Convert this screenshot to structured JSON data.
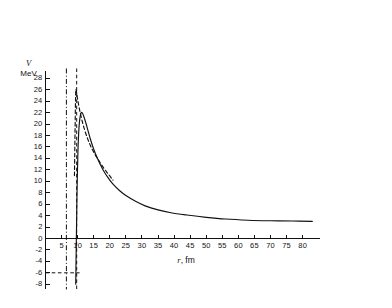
{
  "chart_data": {
    "type": "line",
    "title": "",
    "xlabel": "r, fm",
    "ylabel": "V MeV",
    "ylabel_symbol": "V",
    "ylabel_unit": "MeV",
    "xlim": [
      0,
      85
    ],
    "ylim": [
      -8,
      29
    ],
    "grid": false,
    "legend": "none",
    "x_ticks": [
      5,
      10,
      15,
      20,
      25,
      30,
      35,
      40,
      45,
      50,
      55,
      60,
      65,
      70,
      75,
      80
    ],
    "x_tick_labels": [
      "5",
      "10",
      "15",
      "20",
      "25",
      "30",
      "35",
      "40",
      "45",
      "50",
      "55",
      "60",
      "65",
      "70",
      "75",
      "80"
    ],
    "y_ticks": [
      -8,
      -6,
      -4,
      -2,
      0,
      2,
      4,
      6,
      8,
      10,
      12,
      14,
      16,
      18,
      20,
      22,
      24,
      26,
      28
    ],
    "y_tick_labels": [
      "-8",
      "-6",
      "-4",
      "-2",
      "0",
      "2",
      "4",
      "6",
      "8",
      "10",
      "12",
      "14",
      "16",
      "18",
      "20",
      "22",
      "24",
      "26",
      "28"
    ],
    "series": [
      {
        "name": "solid-potential-curve",
        "style": "solid",
        "color": "#111111",
        "points": [
          [
            9.4,
            -8.0
          ],
          [
            9.5,
            -4.0
          ],
          [
            9.6,
            0.0
          ],
          [
            9.7,
            4.0
          ],
          [
            9.8,
            8.0
          ],
          [
            9.95,
            12.0
          ],
          [
            10.1,
            15.5
          ],
          [
            10.3,
            18.2
          ],
          [
            10.5,
            20.0
          ],
          [
            10.8,
            21.4
          ],
          [
            11.1,
            22.0
          ],
          [
            11.5,
            21.9
          ],
          [
            12.0,
            21.2
          ],
          [
            12.6,
            20.1
          ],
          [
            13.3,
            18.7
          ],
          [
            14.0,
            17.3
          ],
          [
            15.0,
            15.6
          ],
          [
            16.0,
            14.2
          ],
          [
            17.0,
            13.0
          ],
          [
            18.0,
            11.9
          ],
          [
            19.5,
            10.6
          ],
          [
            21.0,
            9.5
          ],
          [
            23.0,
            8.4
          ],
          [
            25.0,
            7.5
          ],
          [
            28.0,
            6.5
          ],
          [
            31.0,
            5.7
          ],
          [
            35.0,
            5.0
          ],
          [
            39.0,
            4.5
          ],
          [
            44.0,
            4.1
          ],
          [
            50.0,
            3.7
          ],
          [
            56.0,
            3.4
          ],
          [
            63.0,
            3.2
          ],
          [
            70.0,
            3.1
          ],
          [
            77.0,
            3.05
          ],
          [
            83.0,
            3.0
          ]
        ]
      },
      {
        "name": "dashed-potential-curve",
        "style": "dashed",
        "color": "#111111",
        "points": [
          [
            9.0,
            11.0
          ],
          [
            9.1,
            15.0
          ],
          [
            9.2,
            19.0
          ],
          [
            9.3,
            23.0
          ],
          [
            9.4,
            25.6
          ],
          [
            9.5,
            26.1
          ],
          [
            9.7,
            25.4
          ],
          [
            10.0,
            24.3
          ],
          [
            10.5,
            22.8
          ],
          [
            11.2,
            21.0
          ],
          [
            12.0,
            19.3
          ],
          [
            13.0,
            17.6
          ],
          [
            14.0,
            16.2
          ],
          [
            15.2,
            14.9
          ],
          [
            16.5,
            13.7
          ],
          [
            18.0,
            12.4
          ],
          [
            19.5,
            11.3
          ],
          [
            21.0,
            10.2
          ]
        ]
      }
    ],
    "reference_lines": [
      {
        "name": "dash-dot-vertical-line",
        "orientation": "vertical",
        "value": 6.5,
        "style": "dash-dot",
        "color": "#111111"
      },
      {
        "name": "dashed-vertical-line",
        "orientation": "vertical",
        "value": 9.7,
        "style": "dashed",
        "color": "#111111"
      },
      {
        "name": "dashed-horizontal-line",
        "orientation": "horizontal",
        "value": -6,
        "style": "dashed",
        "color": "#111111",
        "x_from": 0,
        "x_to": 10.6
      }
    ]
  }
}
